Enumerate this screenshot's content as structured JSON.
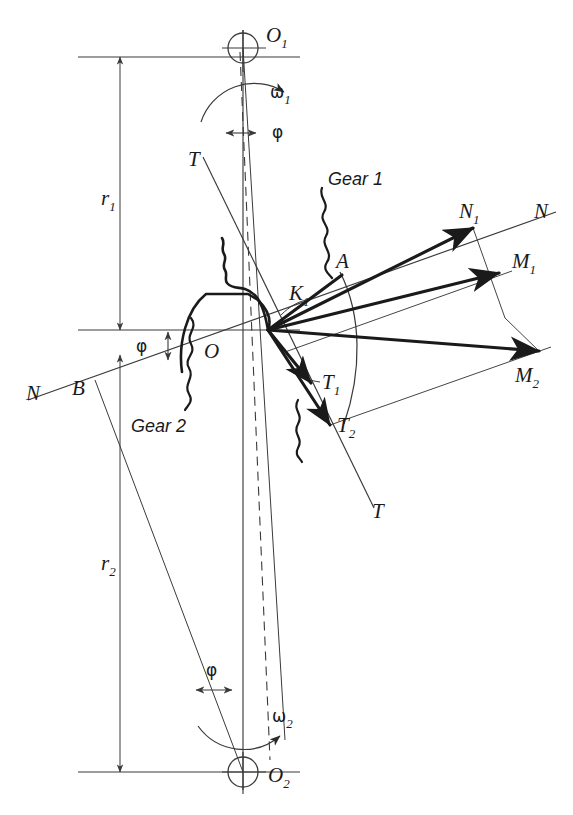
{
  "figure": {
    "type": "engineering-diagram",
    "background": "#ffffff",
    "line_color": "#3a3a3a",
    "heavy_color": "#1a1a1a",
    "width": 573,
    "height": 815
  },
  "labels": {
    "o1": "O",
    "o1_sub": "1",
    "o2": "O",
    "o2_sub": "2",
    "omega1": "ω",
    "omega1_sub": "1",
    "omega2": "ω",
    "omega2_sub": "2",
    "phi1": "φ",
    "phi2": "φ",
    "phi3": "φ",
    "r1": "r",
    "r1_sub": "1",
    "r2": "r",
    "r2_sub": "2",
    "n_left": "N",
    "n_right": "N",
    "n1": "N",
    "n1_sub": "1",
    "m1": "M",
    "m1_sub": "1",
    "m2": "M",
    "m2_sub": "2",
    "t_top": "T",
    "t_bottom": "T",
    "t1": "T",
    "t1_sub": "1",
    "t2": "T",
    "t2_sub": "2",
    "k1": "K",
    "k1_sub": "1",
    "point_a": "A",
    "point_b": "B",
    "pitch_point": "O",
    "gear1": "Gear 1",
    "gear2": "Gear 2"
  },
  "geometry": {
    "o1": [
      243,
      48
    ],
    "o2": [
      243,
      772
    ],
    "pitch_point": [
      265,
      330
    ],
    "contact_k1": [
      268,
      330
    ],
    "n_line_left": [
      28,
      400
    ],
    "n_line_right": [
      556,
      212
    ],
    "t_line_top": [
      203,
      157
    ],
    "t_line_bottom": [
      374,
      508
    ],
    "vector_n1_tip": [
      473,
      228
    ],
    "vector_m1_tip": [
      499,
      273
    ],
    "vector_m2_tip": [
      539,
      351
    ],
    "vector_a": [
      342,
      275
    ],
    "point_b": [
      95,
      380
    ],
    "pressure_angle_deg": 20
  },
  "vectors": [
    {
      "name": "N1",
      "from": "K1",
      "to": [
        473,
        228
      ],
      "label": "N₁",
      "desc": "velocity component along line of action"
    },
    {
      "name": "M1",
      "from": "K1",
      "to": [
        499,
        273
      ],
      "label": "M₁",
      "desc": "total velocity of gear 1 tooth point"
    },
    {
      "name": "M2",
      "from": "K1",
      "to": [
        539,
        351
      ],
      "label": "M₂",
      "desc": "total velocity of gear 2 tooth point"
    },
    {
      "name": "A",
      "from": "K1",
      "to": [
        342,
        275
      ],
      "label": "A",
      "desc": "short vector to arc point A"
    },
    {
      "name": "T1",
      "from": "K1",
      "to": [
        311,
        383
      ],
      "label": "T₁",
      "desc": "tangential component gear 1"
    },
    {
      "name": "T2",
      "from": "K1",
      "to": [
        330,
        425
      ],
      "label": "T₂",
      "desc": "tangential component gear 2"
    }
  ]
}
